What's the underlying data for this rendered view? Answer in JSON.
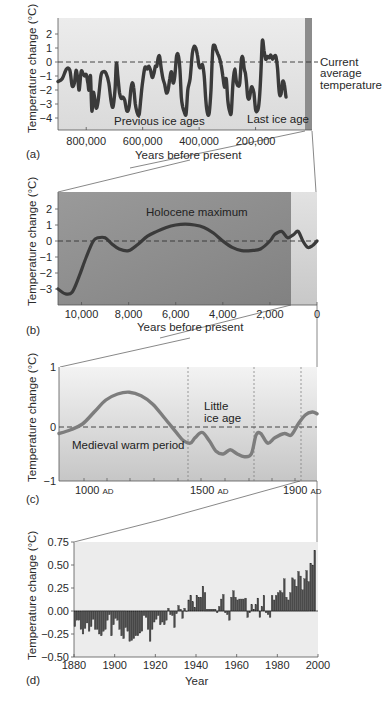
{
  "chart_data": [
    {
      "panel": "(a)",
      "type": "line",
      "xlabel": "Years before present",
      "ylabel": "Temperature change (°C)",
      "xlim": [
        900000,
        0
      ],
      "ylim": [
        -5,
        3
      ],
      "xticks": [
        800000,
        600000,
        400000,
        200000
      ],
      "xtick_labels": [
        "800,000",
        "600,000",
        "400,000",
        "200,000"
      ],
      "yticks": [
        2,
        1,
        0,
        -1,
        -2,
        -3,
        -4
      ],
      "reference_line": {
        "y": 0,
        "label": "Current average temperature",
        "style": "dashed"
      },
      "annotations": [
        {
          "text": "Previous ice ages",
          "x": 530000,
          "y": -4.4
        },
        {
          "text": "Last ice age",
          "x": 110000,
          "y": -4.2
        }
      ],
      "highlight_band": {
        "x": [
          20000,
          0
        ],
        "color": "#8a8a8a"
      },
      "x": [
        900000,
        885000,
        870000,
        858000,
        850000,
        842000,
        836000,
        830000,
        825000,
        818000,
        812000,
        806000,
        800000,
        794000,
        790000,
        785000,
        780000,
        775000,
        770000,
        765000,
        758000,
        748000,
        740000,
        730000,
        720000,
        712000,
        705000,
        698000,
        693000,
        688000,
        682000,
        676000,
        670000,
        664000,
        656000,
        648000,
        642000,
        637000,
        632000,
        626000,
        618000,
        612000,
        606000,
        600000,
        592000,
        584000,
        578000,
        572000,
        566000,
        560000,
        555000,
        550000,
        545000,
        540000,
        534000,
        528000,
        522000,
        516000,
        510000,
        504000,
        498000,
        492000,
        486000,
        480000,
        474000,
        468000,
        463000,
        458000,
        452000,
        446000,
        440000,
        432000,
        424000,
        418000,
        412000,
        406000,
        400000,
        394000,
        388000,
        382000,
        376000,
        370000,
        364000,
        358000,
        352000,
        346000,
        340000,
        334000,
        328000,
        322000,
        316000,
        310000,
        304000,
        298000,
        292000,
        286000,
        280000,
        274000,
        268000,
        262000,
        256000,
        250000,
        245000,
        240000,
        236000,
        232000,
        228000,
        222000,
        216000,
        212000,
        206000,
        200000,
        194000,
        188000,
        182000,
        176000,
        170000,
        164000,
        158000,
        152000,
        146000,
        140000,
        134000,
        128000,
        122000,
        116000,
        110000,
        104000,
        98000,
        92000,
        86000,
        80000,
        74000,
        68000,
        62000,
        56000,
        50000,
        44000,
        38000,
        32000,
        26000,
        20000,
        14000,
        8000,
        2000
      ],
      "y": [
        -1.4,
        -1.2,
        -0.5,
        -0.6,
        -1.7,
        -1.5,
        -0.6,
        -1.2,
        -2.0,
        -0.7,
        -0.8,
        -1.0,
        -0.9,
        -1.5,
        -2.0,
        -1.0,
        -3.5,
        -2.2,
        -2.6,
        -3.3,
        -2.8,
        -1.0,
        -0.7,
        -0.8,
        -1.5,
        -2.8,
        -3.2,
        -2.0,
        -0.1,
        -1.0,
        -2.2,
        -2.6,
        -2.5,
        -2.7,
        -3.5,
        -3.2,
        -2.0,
        -1.5,
        -1.8,
        -3.0,
        -3.7,
        -3.7,
        -2.5,
        -1.4,
        -0.4,
        -0.5,
        -0.3,
        -0.6,
        -1.1,
        -0.8,
        -0.3,
        -0.3,
        0.3,
        0.4,
        -0.5,
        -1.2,
        -1.6,
        -2.2,
        -2.0,
        -1.2,
        -0.7,
        -1.5,
        -1.0,
        0.4,
        0.5,
        -0.5,
        -2.5,
        -3.2,
        -3.6,
        -3.7,
        -2.0,
        -1.2,
        0.6,
        1.1,
        1.0,
        0.5,
        -0.3,
        -0.4,
        -0.2,
        -1.0,
        -2.8,
        -3.7,
        -3.6,
        -2.0,
        0.8,
        1.2,
        0.9,
        0.6,
        0.3,
        -0.2,
        -1.0,
        -1.8,
        -1.2,
        -2.8,
        -3.5,
        -3.6,
        -1.5,
        -0.5,
        -1.4,
        -1.7,
        -1.5,
        0.2,
        0.3,
        -0.5,
        -0.8,
        -1.5,
        -2.5,
        -2.6,
        -1.9,
        -1.8,
        -2.2,
        -3.4,
        -3.5,
        -3.0,
        -1.2,
        1.5,
        0.8,
        0.2,
        0.4,
        0.3,
        0.5,
        0.2,
        0.4,
        0.4,
        -0.5,
        -2.2,
        -2.3,
        -1.4,
        -1.6,
        -2.5,
        -2.8
      ],
      "data_note": "Values digitized approximately from the plot curve"
    },
    {
      "panel": "(b)",
      "type": "line",
      "xlabel": "Years before present",
      "ylabel": "Temperature change (°C)",
      "xlim": [
        11000,
        0
      ],
      "ylim": [
        -4,
        3
      ],
      "xticks": [
        10000,
        8000,
        6000,
        4000,
        2000,
        0
      ],
      "xtick_labels": [
        "10,000",
        "8,000",
        "6,000",
        "4,000",
        "2,000",
        "0"
      ],
      "yticks": [
        2,
        1,
        0,
        -1,
        -2,
        -3
      ],
      "reference_line": {
        "y": 0,
        "style": "dashed"
      },
      "annotations": [
        {
          "text": "Holocene maximum",
          "x": 5800,
          "y": 1.8
        }
      ],
      "highlight_band": {
        "x": [
          1000,
          0
        ],
        "color": "#d4d4d4"
      },
      "x": [
        11000,
        10700,
        10400,
        10100,
        9800,
        9500,
        9300,
        9000,
        8700,
        8400,
        8000,
        7600,
        7200,
        6800,
        6400,
        6000,
        5600,
        5200,
        4800,
        4400,
        4000,
        3600,
        3200,
        2800,
        2400,
        2000,
        1800,
        1500,
        1250,
        1000,
        800,
        600,
        400,
        200,
        0
      ],
      "y": [
        -3.0,
        -3.3,
        -3.2,
        -2.2,
        -1.0,
        0.0,
        0.2,
        0.2,
        -0.2,
        -0.5,
        -0.6,
        -0.2,
        0.3,
        0.6,
        0.85,
        1.0,
        1.05,
        1.0,
        0.85,
        0.5,
        0.0,
        -0.4,
        -0.6,
        -0.6,
        -0.5,
        0.0,
        0.4,
        0.6,
        0.2,
        0.4,
        0.6,
        0.0,
        -0.4,
        -0.3,
        0.0
      ]
    },
    {
      "panel": "(c)",
      "type": "line",
      "xlabel": "",
      "ylabel": "Temperature change (°C)",
      "xlim": [
        900,
        2000
      ],
      "ylim": [
        -1,
        1
      ],
      "xticks": [
        1000,
        1500,
        1900
      ],
      "xtick_labels": [
        "1000 AD",
        "1500 AD",
        "1900 AD"
      ],
      "yticks": [
        1,
        0,
        -1
      ],
      "reference_line": {
        "y": 0,
        "style": "dashed"
      },
      "vertical_dotted_lines": [
        1450,
        1740,
        1940
      ],
      "annotations": [
        {
          "text": "Medieval warm period",
          "x": 1120,
          "y": -0.3
        },
        {
          "text": "Little ice age",
          "x": 1600,
          "y": 0.3
        }
      ],
      "x": [
        900,
        950,
        1000,
        1050,
        1100,
        1150,
        1200,
        1250,
        1300,
        1350,
        1400,
        1430,
        1460,
        1480,
        1510,
        1540,
        1570,
        1600,
        1630,
        1660,
        1690,
        1720,
        1740,
        1760,
        1790,
        1820,
        1860,
        1890,
        1920,
        1950,
        1980,
        2000
      ],
      "y": [
        -0.12,
        -0.05,
        0.05,
        0.25,
        0.45,
        0.55,
        0.58,
        0.52,
        0.38,
        0.15,
        -0.1,
        -0.25,
        -0.3,
        -0.2,
        -0.1,
        -0.25,
        -0.45,
        -0.5,
        -0.42,
        -0.5,
        -0.55,
        -0.5,
        -0.15,
        -0.12,
        -0.3,
        -0.2,
        -0.12,
        -0.15,
        0.05,
        0.2,
        0.25,
        0.22
      ]
    },
    {
      "panel": "(d)",
      "type": "bar",
      "xlabel": "Year",
      "ylabel": "Temperature change (°C)",
      "xlim": [
        1880,
        2000
      ],
      "ylim": [
        -0.5,
        0.75
      ],
      "xticks": [
        1880,
        1900,
        1920,
        1940,
        1960,
        1980,
        2000
      ],
      "xtick_labels": [
        "1880",
        "1900",
        "1920",
        "1940",
        "1960",
        "1980",
        "2000"
      ],
      "yticks": [
        0.75,
        0.5,
        0.25,
        0.0,
        -0.25,
        -0.5
      ],
      "ytick_labels": [
        "0.75",
        "0.50",
        "0.25",
        "0.00",
        "−0.25",
        "−0.50"
      ],
      "categories": [
        1880,
        1881,
        1882,
        1883,
        1884,
        1885,
        1886,
        1887,
        1888,
        1889,
        1890,
        1891,
        1892,
        1893,
        1894,
        1895,
        1896,
        1897,
        1898,
        1899,
        1900,
        1901,
        1902,
        1903,
        1904,
        1905,
        1906,
        1907,
        1908,
        1909,
        1910,
        1911,
        1912,
        1913,
        1914,
        1915,
        1916,
        1917,
        1918,
        1919,
        1920,
        1921,
        1922,
        1923,
        1924,
        1925,
        1926,
        1927,
        1928,
        1929,
        1930,
        1931,
        1932,
        1933,
        1934,
        1935,
        1936,
        1937,
        1938,
        1939,
        1940,
        1941,
        1942,
        1943,
        1944,
        1945,
        1946,
        1947,
        1948,
        1949,
        1950,
        1951,
        1952,
        1953,
        1954,
        1955,
        1956,
        1957,
        1958,
        1959,
        1960,
        1961,
        1962,
        1963,
        1964,
        1965,
        1966,
        1967,
        1968,
        1969,
        1970,
        1971,
        1972,
        1973,
        1974,
        1975,
        1976,
        1977,
        1978,
        1979,
        1980,
        1981,
        1982,
        1983,
        1984,
        1985,
        1986,
        1987,
        1988,
        1989,
        1990,
        1991,
        1992,
        1993,
        1994,
        1995,
        1996,
        1997,
        1998
      ],
      "values": [
        -0.17,
        -0.1,
        -0.1,
        -0.2,
        -0.25,
        -0.19,
        -0.13,
        -0.22,
        -0.17,
        -0.09,
        -0.2,
        -0.2,
        -0.25,
        -0.27,
        -0.22,
        -0.2,
        -0.1,
        -0.04,
        -0.27,
        -0.15,
        -0.08,
        -0.1,
        -0.2,
        -0.27,
        -0.3,
        -0.18,
        -0.22,
        -0.33,
        -0.32,
        -0.3,
        -0.27,
        -0.27,
        -0.24,
        -0.22,
        -0.05,
        -0.07,
        -0.2,
        -0.33,
        -0.2,
        -0.12,
        -0.09,
        -0.05,
        -0.15,
        -0.12,
        -0.15,
        -0.1,
        0.03,
        -0.04,
        -0.05,
        -0.18,
        -0.03,
        0.06,
        0.02,
        -0.08,
        0.03,
        0.0,
        0.12,
        0.17,
        0.1,
        0.04,
        0.17,
        0.15,
        0.15,
        0.27,
        0.2,
        0.02,
        0.02,
        0.02,
        0.02,
        0.02,
        -0.02,
        0.05,
        0.13,
        0.18,
        -0.02,
        -0.04,
        -0.1,
        0.15,
        0.22,
        0.15,
        0.12,
        0.13,
        0.13,
        0.13,
        0.14,
        -0.07,
        -0.02,
        0.07,
        0.02,
        0.07,
        0.14,
        -0.07,
        0.05,
        0.17,
        -0.02,
        -0.04,
        -0.07,
        0.17,
        0.12,
        0.17,
        0.2,
        0.22,
        0.2,
        0.35,
        0.15,
        0.12,
        0.2,
        0.36,
        0.34,
        0.27,
        0.43,
        0.38,
        0.23,
        0.35,
        0.44,
        0.32,
        0.52,
        0.5,
        0.66
      ],
      "data_note": "Annual anomalies digitized approximately from the bars"
    }
  ],
  "labels": {
    "panel_a": "(a)",
    "panel_b": "(b)",
    "panel_c": "(c)",
    "panel_d": "(d)",
    "ylabel": "Temperature change (°C)",
    "xlabel_ab": "Years before present",
    "xlabel_d": "Year",
    "current_avg_1": "Current",
    "current_avg_2": "average",
    "current_avg_3": "temperature",
    "prev_ice": "Previous ice ages",
    "last_ice": "Last ice age",
    "holocene": "Holocene maximum",
    "medieval": "Medieval warm period",
    "little_1": "Little",
    "little_2": "ice age",
    "ad": "AD"
  },
  "colors": {
    "curve_a": "#3a3a3a",
    "curve_b": "#3a3a3a",
    "curve_c": "#7d7d7d",
    "bars": "#4a4a4a",
    "bg_a": "#e4e4e4",
    "band_a": "#8c8c8c",
    "bg_b_dark": "#8f8f8f",
    "bg_b_light": "#b8b8b8",
    "band_b": "#d8d8d8",
    "bg_c_top": "#f0f0f0",
    "bg_c_bottom": "#c8c8c8",
    "bg_d": "#ececec",
    "connector": "#6a6a6a"
  }
}
